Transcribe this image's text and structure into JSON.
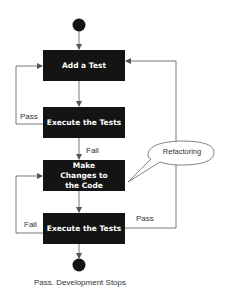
{
  "diagram": {
    "type": "flowchart",
    "nodes": {
      "start": {
        "shape": "circle",
        "label": ""
      },
      "add_test": {
        "label": "Add a Test"
      },
      "execute_tests_1": {
        "label": "Execute the Tests"
      },
      "make_changes": {
        "label": "Make Changes to the Code"
      },
      "execute_tests_2": {
        "label": "Execute the Tests"
      },
      "end": {
        "shape": "circle",
        "label": "Pass. Development Stops"
      }
    },
    "edges": [
      {
        "from": "start",
        "to": "add_test",
        "label": ""
      },
      {
        "from": "add_test",
        "to": "execute_tests_1",
        "label": ""
      },
      {
        "from": "execute_tests_1",
        "to": "add_test",
        "label": "Pass"
      },
      {
        "from": "execute_tests_1",
        "to": "make_changes",
        "label": "Fail"
      },
      {
        "from": "make_changes",
        "to": "execute_tests_2",
        "label": ""
      },
      {
        "from": "execute_tests_2",
        "to": "make_changes",
        "label": "Fail"
      },
      {
        "from": "execute_tests_2",
        "to": "add_test",
        "label": "Pass"
      },
      {
        "from": "execute_tests_2",
        "to": "end",
        "label": ""
      }
    ],
    "callout": {
      "label": "Refactoring",
      "attached_to": "make_changes"
    },
    "labels": {
      "pass_1": "Pass",
      "fail_1": "Fail",
      "fail_2": "Fail",
      "pass_2": "Pass"
    },
    "colors": {
      "box_fill": "#141414",
      "box_text": "#ffffff",
      "line": "#555555",
      "background": "#ffffff"
    }
  }
}
